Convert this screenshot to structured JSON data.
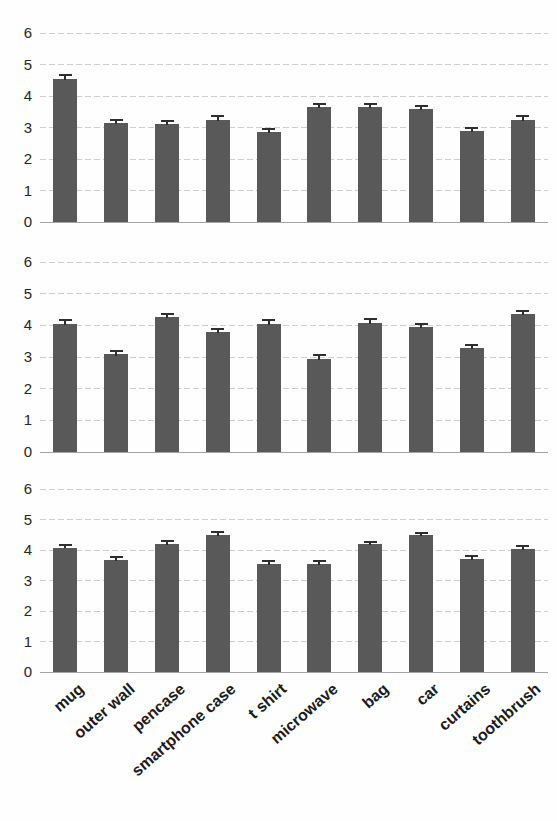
{
  "figure": {
    "title": "",
    "panel_count": 3,
    "bar_color": "#595959",
    "grid_color": "#c9c9c9",
    "axis_color": "#9a9a9a"
  },
  "chart_data": {
    "type": "bar",
    "title": "",
    "xlabel": "",
    "ylabel": "",
    "ylim": [
      0,
      6
    ],
    "yticks": [
      0,
      1,
      2,
      3,
      4,
      5,
      6
    ],
    "ytick_labels": [
      "0",
      "1",
      "2",
      "3",
      "4",
      "5",
      "6"
    ],
    "grid": true,
    "legend": "none",
    "orientation": "vertical",
    "error_bars": "standard error",
    "categories": [
      "mug",
      "outer wall",
      "pencase",
      "smartphone case",
      "t shirt",
      "microwave",
      "bag",
      "car",
      "curtains",
      "toothbrush"
    ],
    "panels": [
      {
        "index": 1,
        "label": "",
        "values": [
          4.55,
          3.15,
          3.1,
          3.25,
          2.85,
          3.65,
          3.65,
          3.6,
          2.9,
          3.25
        ],
        "errors": [
          0.14,
          0.13,
          0.13,
          0.15,
          0.12,
          0.13,
          0.12,
          0.13,
          0.13,
          0.14
        ]
      },
      {
        "index": 2,
        "label": "",
        "values": [
          4.05,
          3.08,
          4.25,
          3.78,
          4.05,
          2.95,
          4.08,
          3.95,
          3.28,
          4.35
        ],
        "errors": [
          0.14,
          0.14,
          0.13,
          0.14,
          0.14,
          0.14,
          0.14,
          0.13,
          0.14,
          0.14
        ]
      },
      {
        "index": 3,
        "label": "",
        "values": [
          4.08,
          3.68,
          4.2,
          4.5,
          3.55,
          3.55,
          4.2,
          4.48,
          3.7,
          4.03
        ],
        "errors": [
          0.12,
          0.13,
          0.12,
          0.12,
          0.11,
          0.12,
          0.11,
          0.12,
          0.12,
          0.13
        ]
      }
    ],
    "series": [
      {
        "name": "panel 1",
        "values": [
          4.55,
          3.15,
          3.1,
          3.25,
          2.85,
          3.65,
          3.65,
          3.6,
          2.9,
          3.25
        ]
      },
      {
        "name": "panel 2",
        "values": [
          4.05,
          3.08,
          4.25,
          3.78,
          4.05,
          2.95,
          4.08,
          3.95,
          3.28,
          4.35
        ]
      },
      {
        "name": "panel 3",
        "values": [
          4.08,
          3.68,
          4.2,
          4.5,
          3.55,
          3.55,
          4.2,
          4.48,
          3.7,
          4.03
        ]
      }
    ]
  },
  "geometry": {
    "panels": [
      {
        "top_y": 33,
        "base_y": 222
      },
      {
        "top_y": 262,
        "base_y": 452
      },
      {
        "top_y": 489,
        "base_y": 672
      }
    ],
    "plot_left": 40,
    "plot_right": 548,
    "bar_width": 24,
    "ytick_label_x": 10
  }
}
